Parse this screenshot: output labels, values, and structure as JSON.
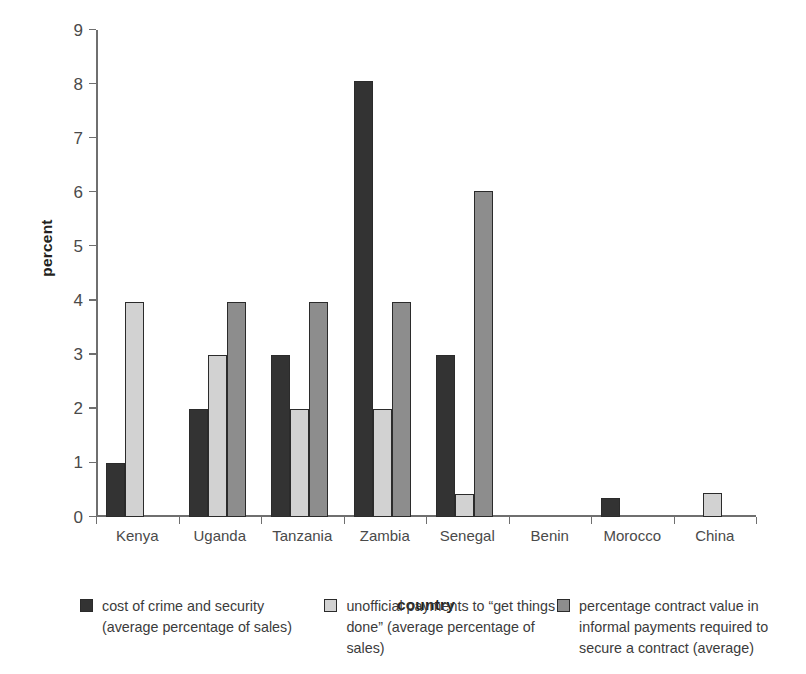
{
  "chart_data": {
    "type": "bar",
    "title": "",
    "subtitle": "",
    "xlabel": "country",
    "ylabel": "percent",
    "ylim": [
      0,
      9
    ],
    "ytick_values": [
      0,
      1,
      2,
      3,
      4,
      5,
      6,
      7,
      8,
      9
    ],
    "ytick_labels": [
      "0",
      "1",
      "2",
      "3",
      "4",
      "5",
      "6",
      "7",
      "8",
      "9"
    ],
    "grid": false,
    "legend_position": "bottom",
    "categories": [
      "Kenya",
      "Uganda",
      "Tanzania",
      "Zambia",
      "Senegal",
      "Benin",
      "Morocco",
      "China"
    ],
    "series": [
      {
        "name": "cost of crime and security (average percentage of sales)",
        "legend_line1": "cost of crime and security",
        "legend_line2": "(average percentage of sales)",
        "color": "#333333",
        "values": [
          1.0,
          2.0,
          3.0,
          8.05,
          3.0,
          null,
          0.35,
          null
        ]
      },
      {
        "name": "unofficial payments to “get things done” (average percentage of sales)",
        "legend_line1": "unofficial payments to “get things",
        "legend_line2": "done” (average percentage of sales)",
        "color": "#d2d2d2",
        "values": [
          3.98,
          3.0,
          2.0,
          2.0,
          0.42,
          null,
          null,
          0.45
        ]
      },
      {
        "name": "percentage contract value in informal payments required to secure a contract (average)",
        "legend_line1": "percentage contract value in",
        "legend_line2": "informal payments required to",
        "legend_line3": "secure a contract (average)",
        "color": "#8d8d8d",
        "values": [
          null,
          3.98,
          3.98,
          3.98,
          6.03,
          null,
          null,
          null
        ]
      }
    ]
  },
  "axes": {
    "y_title": "percent",
    "x_title": "country"
  },
  "colors": {
    "series1": "#333333",
    "series2": "#d2d2d2",
    "series3": "#8d8d8d",
    "axis": "#6f6f6f",
    "text": "#3b3b3b",
    "background": "#ffffff"
  }
}
